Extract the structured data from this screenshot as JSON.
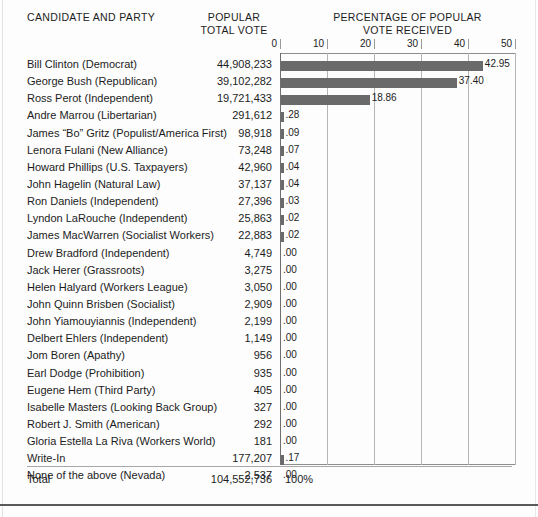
{
  "header": {
    "col_candidate": "CANDIDATE AND PARTY",
    "col_popular_line1": "POPULAR",
    "col_popular_line2": "TOTAL VOTE",
    "col_pct_line1": "PERCENTAGE OF POPULAR",
    "col_pct_line2": "VOTE RECEIVED"
  },
  "total_row": {
    "label": "Total",
    "votes": "104,552,736",
    "percent": "100%"
  },
  "colors": {
    "bar": "#6a6a6a",
    "gridline": "#b5b5b5",
    "axis": "#6f6f6f",
    "text": "#1c1c1c",
    "background": "#fdfdfd"
  },
  "chart_data": {
    "type": "bar",
    "orientation": "horizontal",
    "title": "PERCENTAGE OF POPULAR VOTE RECEIVED",
    "xlabel": "",
    "ylabel": "",
    "xlim": [
      0,
      50
    ],
    "xticks": [
      0,
      10,
      20,
      30,
      40,
      50
    ],
    "xtick_labels": [
      "0",
      "10",
      "20",
      "30",
      "40",
      "50"
    ],
    "grid": true,
    "legend": false,
    "value_label_format": "two-decimal, leading zero omitted",
    "categories": [
      "Bill Clinton (Democrat)",
      "George Bush (Republican)",
      "Ross Perot (Independent)",
      "Andre Marrou (Libertarian)",
      "James “Bo” Gritz (Populist/America First)",
      "Lenora Fulani (New Alliance)",
      "Howard Phillips (U.S. Taxpayers)",
      "John Hagelin (Natural Law)",
      "Ron Daniels (Independent)",
      "Lyndon LaRouche (Independent)",
      "James MacWarren (Socialist Workers)",
      "Drew Bradford (Independent)",
      "Jack Herer (Grassroots)",
      "Helen Halyard (Workers League)",
      "John Quinn Brisben (Socialist)",
      "John Yiamouyiannis (Independent)",
      "Delbert Ehlers (Independent)",
      "Jom Boren (Apathy)",
      "Earl Dodge (Prohibition)",
      "Eugene Hem (Third Party)",
      "Isabelle Masters (Looking Back Group)",
      "Robert J. Smith (American)",
      "Gloria Estella La Riva (Workers World)",
      "Write-In",
      "None of the above (Nevada)"
    ],
    "values": [
      42.95,
      37.4,
      18.86,
      0.28,
      0.09,
      0.07,
      0.04,
      0.04,
      0.03,
      0.02,
      0.02,
      0.0,
      0.0,
      0.0,
      0.0,
      0.0,
      0.0,
      0.0,
      0.0,
      0.0,
      0.0,
      0.0,
      0.0,
      0.17,
      0.0
    ],
    "value_labels": [
      "42.95",
      "37.40",
      "18.86",
      ".28",
      ".09",
      ".07",
      ".04",
      ".04",
      ".03",
      ".02",
      ".02",
      ".00",
      ".00",
      ".00",
      ".00",
      ".00",
      ".00",
      ".00",
      ".00",
      ".00",
      ".00",
      ".00",
      ".00",
      ".17",
      ".00"
    ],
    "votes": [
      "44,908,233",
      "39,102,282",
      "19,721,433",
      "291,612",
      "98,918",
      "73,248",
      "42,960",
      "37,137",
      "27,396",
      "25,863",
      "22,883",
      "4,749",
      "3,275",
      "3,050",
      "2,909",
      "2,199",
      "1,149",
      "956",
      "935",
      "405",
      "327",
      "292",
      "181",
      "177,207",
      "2,537"
    ],
    "total_votes": "104,552,736",
    "total_percent": "100%"
  }
}
